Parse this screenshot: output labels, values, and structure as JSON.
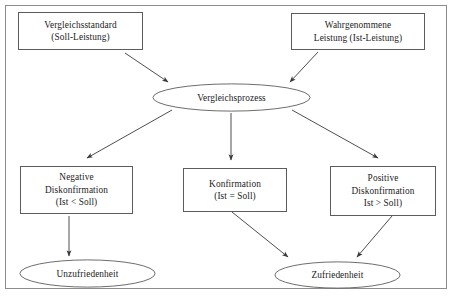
{
  "diagram": {
    "background_color": "#ffffff",
    "border_color": "#8d8d8d",
    "shape_stroke_color": "#5c5c5c",
    "text_color": "#1c1c1c",
    "arrow_color": "#3a3a3a"
  },
  "nodes": {
    "comparison_standard": {
      "shape": "rectangle",
      "line1": "Vergleichsstandard",
      "line2": "(Soll-Leistung)"
    },
    "perceived_performance": {
      "shape": "rectangle",
      "line1": "Wahrgenommene",
      "line2": "Leistung (Ist-Leistung)"
    },
    "comparison_process": {
      "shape": "ellipse",
      "label": "Vergleichsprozess"
    },
    "negative_disconfirmation": {
      "shape": "rectangle",
      "line1": "Negative",
      "line2": "Diskonfirmation",
      "line3": "(Ist < Soll)"
    },
    "confirmation": {
      "shape": "rectangle",
      "line1": "Konfirmation",
      "line2": "(Ist = Soll)"
    },
    "positive_disconfirmation": {
      "shape": "rectangle",
      "line1": "Positive",
      "line2": "Diskonfirmation",
      "line3": "Ist > Soll)"
    },
    "dissatisfaction": {
      "shape": "ellipse",
      "label": "Unzufriedenheit"
    },
    "satisfaction": {
      "shape": "ellipse",
      "label": "Zufriedenheit"
    }
  },
  "edges": [
    {
      "name": "standard-to-process",
      "from": "comparison_standard",
      "to": "comparison_process",
      "style": "diagonal-arrow"
    },
    {
      "name": "perceived-to-process",
      "from": "perceived_performance",
      "to": "comparison_process",
      "style": "diagonal-arrow"
    },
    {
      "name": "process-to-negative",
      "from": "comparison_process",
      "to": "negative_disconfirmation",
      "style": "diagonal-arrow"
    },
    {
      "name": "process-to-confirmation",
      "from": "comparison_process",
      "to": "confirmation",
      "style": "vertical-arrow"
    },
    {
      "name": "process-to-positive",
      "from": "comparison_process",
      "to": "positive_disconfirmation",
      "style": "diagonal-arrow"
    },
    {
      "name": "negative-to-dissatisfaction",
      "from": "negative_disconfirmation",
      "to": "dissatisfaction",
      "style": "vertical-arrow"
    },
    {
      "name": "confirmation-to-satisfaction",
      "from": "confirmation",
      "to": "satisfaction",
      "style": "diagonal-arrow"
    },
    {
      "name": "positive-to-satisfaction",
      "from": "positive_disconfirmation",
      "to": "satisfaction",
      "style": "diagonal-arrow"
    }
  ]
}
